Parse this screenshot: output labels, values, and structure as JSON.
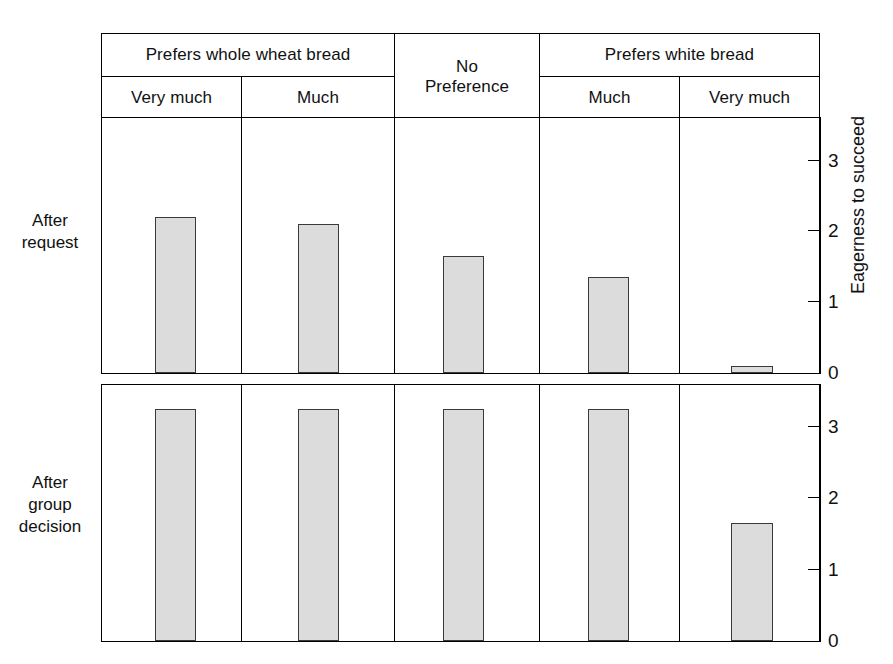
{
  "figure": {
    "axis_title": "Eagerness to succeed",
    "row_labels": {
      "top": [
        "After",
        "request"
      ],
      "bottom": [
        "After",
        "group",
        "decision"
      ]
    },
    "header": {
      "group_row": [
        {
          "label": "Prefers whole wheat bread",
          "span": 2
        },
        {
          "label": "No\nPreference",
          "span": 1,
          "spans_both_rows": true
        },
        {
          "label": "Prefers white bread",
          "span": 2
        }
      ],
      "sub_row": [
        "Very much",
        "Much",
        "Much",
        "Very much"
      ],
      "cells": {
        "prefers_whole_wheat": "Prefers whole wheat bread",
        "no_preference_line1": "No",
        "no_preference_line2": "Preference",
        "prefers_white": "Prefers white bread",
        "ww_very_much": "Very much",
        "ww_much": "Much",
        "wb_much": "Much",
        "wb_very_much": "Very much"
      }
    },
    "colors": {
      "bar_fill": "#dcdcdc",
      "bar_stroke": "#3a3a3a",
      "frame": "#000000",
      "background": "#ffffff",
      "text": "#111111"
    }
  },
  "chart_data": {
    "type": "bar",
    "title": "",
    "xlabel": "",
    "ylabel": "Eagerness to succeed",
    "grid": false,
    "legend": "none",
    "categories": [
      "Prefers whole wheat bread - Very much",
      "Prefers whole wheat bread - Much",
      "No Preference",
      "Prefers white bread - Much",
      "Prefers white bread - Very much"
    ],
    "category_short": [
      "Very much",
      "Much",
      "No Preference",
      "Much",
      "Very much"
    ],
    "panels": [
      {
        "name": "After request",
        "ylim": [
          0,
          3.6
        ],
        "yticks": [
          0,
          1,
          2,
          3
        ],
        "ytick_labels": [
          "0",
          "1",
          "2",
          "3"
        ],
        "values": [
          2.2,
          2.1,
          1.65,
          1.35,
          0.1
        ]
      },
      {
        "name": "After group decision",
        "ylim": [
          0,
          3.6
        ],
        "yticks": [
          0,
          1,
          2,
          3
        ],
        "ytick_labels": [
          "0",
          "1",
          "2",
          "3"
        ],
        "values": [
          3.25,
          3.25,
          3.25,
          3.25,
          1.65
        ]
      }
    ],
    "series": [
      {
        "name": "After request",
        "values": [
          2.2,
          2.1,
          1.65,
          1.35,
          0.1
        ]
      },
      {
        "name": "After group decision",
        "values": [
          3.25,
          3.25,
          3.25,
          3.25,
          1.65
        ]
      }
    ]
  }
}
